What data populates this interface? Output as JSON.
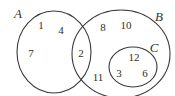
{
  "diagram": {
    "kind": "venn-diagram",
    "background_color": "#ffffff",
    "stroke_color": "#3a3a3a",
    "text_color": "#2e2e2e",
    "sets": [
      {
        "id": "A",
        "label": "A",
        "label_x": 18,
        "label_y": 13
      },
      {
        "id": "B",
        "label": "B",
        "label_y": 16,
        "label_x": 159
      },
      {
        "id": "C",
        "label": "C",
        "label_x": 154,
        "label_y": 47
      }
    ],
    "regions": {
      "A_only": {
        "name": "A only",
        "elements": [
          "1",
          "4",
          "7"
        ]
      },
      "A_and_B": {
        "name": "A intersect B",
        "elements": [
          "2"
        ]
      },
      "B_only": {
        "name": "B only (outside C)",
        "elements": [
          "8",
          "10",
          "11"
        ]
      },
      "C": {
        "name": "C inside B",
        "elements": [
          "12",
          "3",
          "6"
        ]
      }
    },
    "elements": [
      {
        "value": "1",
        "x": 41,
        "y": 25,
        "region": "A_only"
      },
      {
        "value": "4",
        "x": 61,
        "y": 30,
        "region": "A_only"
      },
      {
        "value": "7",
        "x": 31,
        "y": 53,
        "region": "A_only"
      },
      {
        "value": "2",
        "x": 81,
        "y": 53,
        "region": "A_and_B"
      },
      {
        "value": "8",
        "x": 103,
        "y": 27,
        "region": "B_only"
      },
      {
        "value": "10",
        "x": 126,
        "y": 25,
        "region": "B_only"
      },
      {
        "value": "11",
        "x": 98,
        "y": 77,
        "region": "B_only"
      },
      {
        "value": "12",
        "x": 134,
        "y": 57,
        "region": "C"
      },
      {
        "value": "3",
        "x": 119,
        "y": 73,
        "region": "C"
      },
      {
        "value": "6",
        "x": 145,
        "y": 73,
        "region": "C"
      }
    ]
  }
}
